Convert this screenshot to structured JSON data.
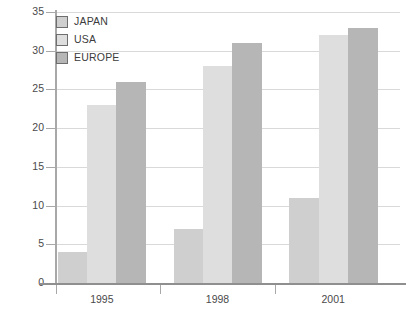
{
  "chart_data": {
    "type": "bar",
    "title": "",
    "xlabel": "",
    "ylabel": "",
    "categories": [
      "1995",
      "1998",
      "2001"
    ],
    "series": [
      {
        "name": "JAPAN",
        "values": [
          4,
          7,
          11
        ],
        "color": "#cfcfcf"
      },
      {
        "name": "USA",
        "values": [
          23,
          28,
          32
        ],
        "color": "#dedede"
      },
      {
        "name": "EUROPE",
        "values": [
          26,
          31,
          33
        ],
        "color": "#b6b6b6"
      }
    ],
    "ylim": [
      0,
      35
    ],
    "ytick_labels": [
      "0",
      "5",
      "10",
      "15",
      "20",
      "25",
      "30",
      "35"
    ],
    "ytick_values": [
      0,
      5,
      10,
      15,
      20,
      25,
      30,
      35
    ],
    "grid": true,
    "grid_color": "#d9d9d9",
    "axis_color": "#a8a8a8",
    "legend_position": "top-left",
    "legend": [
      "JAPAN",
      "USA",
      "EUROPE"
    ],
    "background": "#ffffff"
  }
}
